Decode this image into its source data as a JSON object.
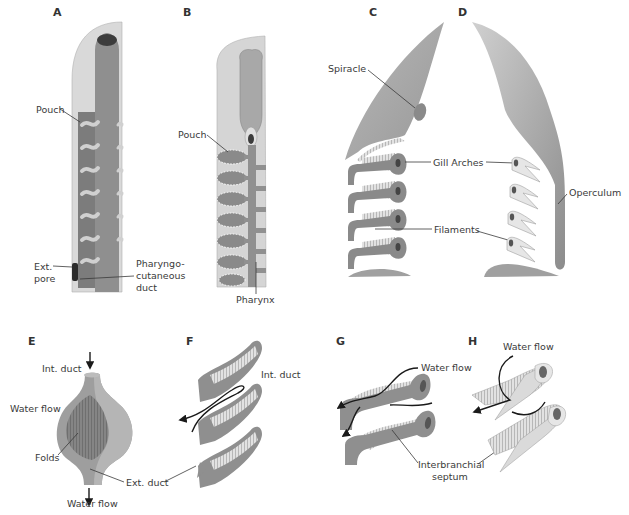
{
  "figure": {
    "colors": {
      "tissue_dark": "#7d7d7d",
      "tissue_mid": "#a3a3a3",
      "tissue_light": "#d6d6d6",
      "tissue_pale": "#e6e6e6",
      "text": "#3a3a3a",
      "arrow": "#1a1a1a"
    },
    "panels": [
      {
        "id": "A",
        "letter": "A",
        "labels": [
          "Pouch",
          "Ext. pore",
          "Pharyngo-cutaneous duct"
        ]
      },
      {
        "id": "B",
        "letter": "B",
        "labels": [
          "Pouch",
          "Pharynx"
        ]
      },
      {
        "id": "C",
        "letter": "C",
        "labels": [
          "Spiracle",
          "Gill Arches",
          "Filaments"
        ]
      },
      {
        "id": "D",
        "letter": "D",
        "labels": [
          "Operculum"
        ]
      },
      {
        "id": "E",
        "letter": "E",
        "labels": [
          "Int. duct",
          "Water flow",
          "Folds",
          "Ext. duct",
          "Water flow"
        ]
      },
      {
        "id": "F",
        "letter": "F",
        "labels": [
          "Int. duct"
        ]
      },
      {
        "id": "G",
        "letter": "G",
        "labels": [
          "Water flow",
          "Interbranchial septum"
        ]
      },
      {
        "id": "H",
        "letter": "H",
        "labels": [
          "Water flow"
        ]
      }
    ]
  },
  "labels": {
    "A": {
      "letter": "A",
      "pouch": "Pouch",
      "ext_pore_1": "Ext.",
      "ext_pore_2": "pore",
      "pcd_1": "Pharyngo-",
      "pcd_2": "cutaneous",
      "pcd_3": "duct"
    },
    "B": {
      "letter": "B",
      "pouch": "Pouch",
      "pharynx": "Pharynx"
    },
    "C": {
      "letter": "C",
      "spiracle": "Spiracle",
      "gill_arches": "Gill Arches",
      "filaments": "Filaments"
    },
    "D": {
      "letter": "D",
      "operculum": "Operculum"
    },
    "E": {
      "letter": "E",
      "int_duct": "Int. duct",
      "water_flow_in": "Water flow",
      "folds": "Folds",
      "ext_duct": "Ext. duct",
      "water_flow_out": "Water flow"
    },
    "F": {
      "letter": "F",
      "int_duct": "Int. duct"
    },
    "G": {
      "letter": "G",
      "water_flow": "Water flow",
      "septum_1": "Interbranchial",
      "septum_2": "septum"
    },
    "H": {
      "letter": "H",
      "water_flow": "Water flow"
    }
  }
}
